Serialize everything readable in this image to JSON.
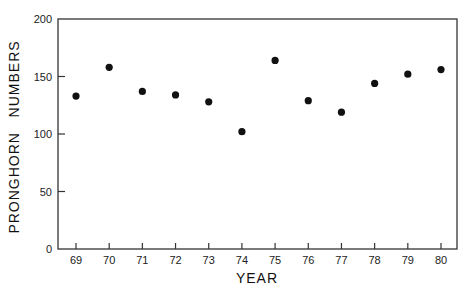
{
  "chart_data": {
    "type": "scatter",
    "title": "",
    "xlabel": "YEAR",
    "ylabel": "PRONGHORN   NUMBERS",
    "x": [
      69,
      70,
      71,
      72,
      73,
      74,
      75,
      76,
      77,
      78,
      79,
      80
    ],
    "categories": [
      "69",
      "70",
      "71",
      "72",
      "73",
      "74",
      "75",
      "76",
      "77",
      "78",
      "79",
      "80"
    ],
    "values": [
      133,
      158,
      137,
      134,
      128,
      102,
      164,
      129,
      119,
      144,
      152,
      156
    ],
    "series": [
      {
        "name": "Pronghorn numbers",
        "values": [
          133,
          158,
          137,
          134,
          128,
          102,
          164,
          129,
          119,
          144,
          152,
          156
        ]
      }
    ],
    "ylim": [
      0,
      200
    ],
    "yticks": [
      0,
      50,
      100,
      150,
      200
    ],
    "xticks": [
      "69",
      "70",
      "71",
      "72",
      "73",
      "74",
      "75",
      "76",
      "77",
      "78",
      "79",
      "80"
    ],
    "grid": false,
    "legend": null,
    "colors": {
      "axis": "#333333",
      "marker": "#111111",
      "background": "#ffffff"
    }
  }
}
